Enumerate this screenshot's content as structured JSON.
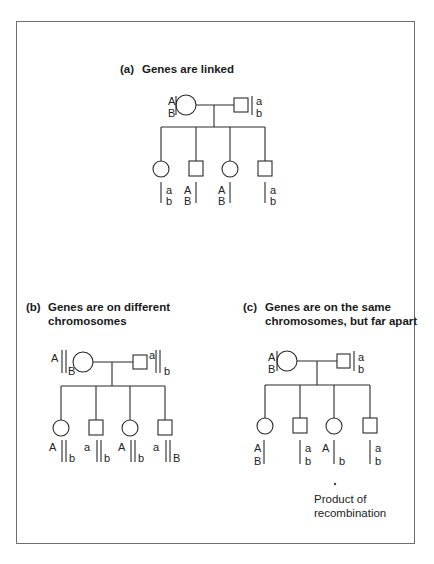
{
  "figure": {
    "frame_color": "#6f6f6f",
    "line_color": "#2a2a2a",
    "panels": [
      {
        "id": "a",
        "tag": "(a)",
        "title_lines": [
          "Genes are linked"
        ],
        "title_pos": [
          120,
          62
        ],
        "parents": {
          "mother": {
            "cx": 186,
            "cy": 105,
            "r": 10,
            "labels": [
              {
                "t": "A",
                "x": 168,
                "y": 101
              },
              {
                "t": "B",
                "x": 168,
                "y": 113
              }
            ],
            "bars": [
              [
                176,
                96,
                176,
                115
              ]
            ]
          },
          "father": {
            "x": 234,
            "y": 98,
            "w": 14,
            "h": 14,
            "labels": [
              {
                "t": "a",
                "x": 256,
                "y": 101
              },
              {
                "t": "b",
                "x": 256,
                "y": 113
              }
            ],
            "bars": [
              [
                252,
                96,
                252,
                115
              ]
            ]
          },
          "marriage_y": 105,
          "descent_x": 214
        },
        "sibship": {
          "y": 127,
          "x1": 161,
          "x2": 265
        },
        "children": [
          {
            "sex": "female",
            "cx": 161,
            "top": 161,
            "labels": [
              {
                "t": "a",
                "x": 166,
                "y": 190
              },
              {
                "t": "b",
                "x": 166,
                "y": 201
              }
            ],
            "bars": [
              [
                161,
                182,
                161,
                203
              ]
            ]
          },
          {
            "sex": "male",
            "cx": 196,
            "top": 161,
            "labels": [
              {
                "t": "A",
                "x": 184,
                "y": 190
              },
              {
                "t": "B",
                "x": 184,
                "y": 201
              }
            ],
            "bars": [
              [
                196,
                182,
                196,
                203
              ]
            ]
          },
          {
            "sex": "female",
            "cx": 230,
            "top": 161,
            "labels": [
              {
                "t": "A",
                "x": 218,
                "y": 190
              },
              {
                "t": "B",
                "x": 218,
                "y": 201
              }
            ],
            "bars": [
              [
                230,
                182,
                230,
                203
              ]
            ]
          },
          {
            "sex": "male",
            "cx": 265,
            "top": 161,
            "labels": [
              {
                "t": "a",
                "x": 270,
                "y": 190
              },
              {
                "t": "b",
                "x": 270,
                "y": 201
              }
            ],
            "bars": [
              [
                265,
                182,
                265,
                203
              ]
            ]
          }
        ]
      },
      {
        "id": "b",
        "tag": "(b)",
        "title_lines": [
          "Genes are on different",
          "chromosomes"
        ],
        "title_pos": [
          26,
          300
        ],
        "parents": {
          "mother": {
            "cx": 83,
            "cy": 362,
            "r": 10,
            "labels": [
              {
                "t": "A",
                "x": 51,
                "y": 358
              },
              {
                "t": "B",
                "x": 68,
                "y": 371
              }
            ],
            "bars": [
              [
                62,
                350,
                62,
                373
              ],
              [
                66,
                350,
                66,
                373
              ]
            ]
          },
          "father": {
            "x": 133,
            "y": 355,
            "w": 14,
            "h": 14,
            "labels": [
              {
                "t": "a",
                "x": 149,
                "y": 355
              },
              {
                "t": "b",
                "x": 164,
                "y": 371
              }
            ],
            "bars": [
              [
                156,
                350,
                156,
                373
              ],
              [
                160,
                350,
                160,
                373
              ]
            ]
          },
          "marriage_y": 362,
          "descent_x": 112
        },
        "sibship": {
          "y": 386,
          "x1": 61,
          "x2": 165
        },
        "children": [
          {
            "sex": "female",
            "cx": 61,
            "top": 420,
            "labels": [
              {
                "t": "A",
                "x": 49,
                "y": 447
              },
              {
                "t": "b",
                "x": 69,
                "y": 458
              }
            ],
            "bars": [
              [
                62,
                440,
                62,
                462
              ],
              [
                66,
                440,
                66,
                462
              ]
            ]
          },
          {
            "sex": "male",
            "cx": 96,
            "top": 420,
            "labels": [
              {
                "t": "a",
                "x": 84,
                "y": 447
              },
              {
                "t": "b",
                "x": 104,
                "y": 458
              }
            ],
            "bars": [
              [
                97,
                440,
                97,
                462
              ],
              [
                101,
                440,
                101,
                462
              ]
            ]
          },
          {
            "sex": "female",
            "cx": 130,
            "top": 420,
            "labels": [
              {
                "t": "A",
                "x": 118,
                "y": 447
              },
              {
                "t": "b",
                "x": 138,
                "y": 458
              }
            ],
            "bars": [
              [
                131,
                440,
                131,
                462
              ],
              [
                135,
                440,
                135,
                462
              ]
            ]
          },
          {
            "sex": "male",
            "cx": 165,
            "top": 420,
            "labels": [
              {
                "t": "a",
                "x": 153,
                "y": 447
              },
              {
                "t": "B",
                "x": 173,
                "y": 458
              }
            ],
            "bars": [
              [
                166,
                440,
                166,
                462
              ],
              [
                170,
                440,
                170,
                462
              ]
            ]
          }
        ]
      },
      {
        "id": "c",
        "tag": "(c)",
        "title_lines": [
          "Genes are on the same",
          "chromosomes, but far apart"
        ],
        "title_pos": [
          243,
          300
        ],
        "parents": {
          "mother": {
            "cx": 287,
            "cy": 361,
            "r": 10,
            "labels": [
              {
                "t": "A",
                "x": 268,
                "y": 357
              },
              {
                "t": "B",
                "x": 268,
                "y": 369
              }
            ],
            "bars": [
              [
                277,
                351,
                277,
                371
              ]
            ]
          },
          "father": {
            "x": 337,
            "y": 354,
            "w": 13,
            "h": 14,
            "labels": [
              {
                "t": "a",
                "x": 358,
                "y": 357
              },
              {
                "t": "b",
                "x": 358,
                "y": 369
              }
            ],
            "bars": [
              [
                354,
                351,
                354,
                371
              ]
            ]
          },
          "marriage_y": 361,
          "descent_x": 317
        },
        "sibship": {
          "y": 385,
          "x1": 265,
          "x2": 370
        },
        "children": [
          {
            "sex": "female",
            "cx": 265,
            "top": 418,
            "labels": [
              {
                "t": "A",
                "x": 254,
                "y": 448
              },
              {
                "t": "B",
                "x": 254,
                "y": 461
              }
            ],
            "bars": [
              [
                264,
                440,
                264,
                464
              ]
            ]
          },
          {
            "sex": "male",
            "cx": 300,
            "top": 418,
            "labels": [
              {
                "t": "a",
                "x": 305,
                "y": 448
              },
              {
                "t": "b",
                "x": 305,
                "y": 461
              }
            ],
            "bars": [
              [
                300,
                440,
                300,
                464
              ]
            ]
          },
          {
            "sex": "female",
            "cx": 334,
            "top": 418,
            "labels": [
              {
                "t": "A",
                "x": 322,
                "y": 448
              },
              {
                "t": "b",
                "x": 339,
                "y": 461
              }
            ],
            "bars": [
              [
                334,
                440,
                334,
                464
              ]
            ]
          },
          {
            "sex": "male",
            "cx": 370,
            "top": 418,
            "labels": [
              {
                "t": "a",
                "x": 375,
                "y": 448
              },
              {
                "t": "b",
                "x": 375,
                "y": 461
              }
            ],
            "bars": [
              [
                370,
                440,
                370,
                464
              ]
            ]
          }
        ]
      }
    ],
    "recombination_note": {
      "marker": "*",
      "lines": [
        "Product of",
        "recombination"
      ],
      "marker_pos": [
        335,
        484
      ],
      "text_pos": [
        314,
        492
      ]
    }
  }
}
